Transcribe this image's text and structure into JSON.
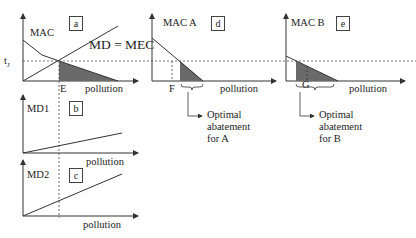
{
  "panels": {
    "a": {
      "box": "a",
      "curve_label": "MAC",
      "line_label": "MD = MEC",
      "price_label": "tJ",
      "x_marker": "E",
      "xlabel": "pollution"
    },
    "b": {
      "box": "b",
      "ylabel": "MD1",
      "xlabel": "pollution"
    },
    "c": {
      "box": "c",
      "ylabel": "MD2",
      "xlabel": "pollution"
    },
    "d": {
      "box": "d",
      "ylabel": "MAC A",
      "x_marker": "F",
      "xlabel": "pollution",
      "annotation": [
        "Optimal",
        "abatement",
        "for A"
      ]
    },
    "e": {
      "box": "e",
      "ylabel": "MAC B",
      "x_marker": "G",
      "xlabel": "pollution",
      "annotation": [
        "Optimal",
        "abatement",
        "for B"
      ]
    }
  },
  "colors": {
    "line": "#333333",
    "shade": "#666666",
    "dash": "#555555"
  }
}
